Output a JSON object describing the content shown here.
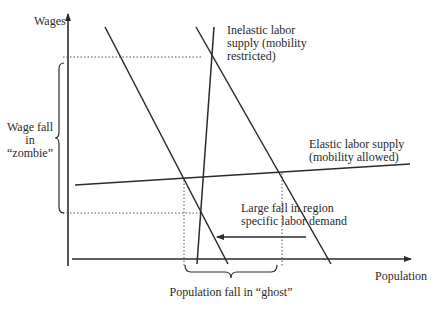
{
  "diagram": {
    "axes": {
      "y_label": "Wages",
      "x_label": "Population"
    },
    "labels": {
      "inelastic_supply_line1": "Inelastic labor",
      "inelastic_supply_line2": "supply (mobility",
      "inelastic_supply_line3": "restricted)",
      "elastic_supply_line1": "Elastic labor supply",
      "elastic_supply_line2": "(mobility allowed)",
      "demand_shift_line1": "Large fall in region",
      "demand_shift_line2": "specific  labor demand",
      "wage_fall_line1": "Wage fall",
      "wage_fall_line2": "in",
      "wage_fall_line3": "“zombie”",
      "population_fall": "Population fall in “ghost”"
    },
    "curves": [
      {
        "name": "original-labor-demand",
        "from": [
          196,
          27
        ],
        "to": [
          331,
          264
        ]
      },
      {
        "name": "reduced-labor-demand",
        "from": [
          105,
          27
        ],
        "to": [
          228,
          264
        ]
      },
      {
        "name": "inelastic-labor-supply",
        "from": [
          214,
          27
        ],
        "to": [
          197,
          264
        ]
      },
      {
        "name": "elastic-labor-supply",
        "from": [
          75,
          185
        ],
        "to": [
          410,
          164
        ]
      }
    ],
    "colors": {
      "line": "#2a2a2a",
      "background": "#ffffff"
    }
  }
}
